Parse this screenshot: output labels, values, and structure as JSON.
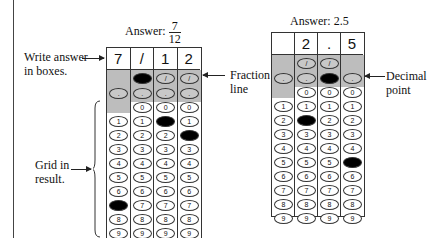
{
  "left_example": {
    "answer_label": "Answer:",
    "answer_numerator": "7",
    "answer_denominator": "12",
    "boxes": [
      "7",
      "/",
      "1",
      "2"
    ],
    "fraction_row_filled_col": 1,
    "fraction_row_cols": [
      2,
      3
    ],
    "decimal_row_cols": [
      0,
      1,
      2,
      3
    ],
    "zero_row_cols": [
      1,
      2,
      3
    ],
    "digits": [
      "0",
      "1",
      "2",
      "3",
      "4",
      "5",
      "6",
      "7",
      "8",
      "9"
    ],
    "filled_digits": [
      {
        "col": 0,
        "digit": "7"
      },
      {
        "col": 2,
        "digit": "1"
      },
      {
        "col": 3,
        "digit": "2"
      }
    ],
    "annotations": {
      "write_answer": [
        "Write answer",
        "in boxes."
      ],
      "fraction_line": [
        "Fraction",
        "line"
      ],
      "grid_in": [
        "Grid in",
        "result."
      ]
    }
  },
  "right_example": {
    "answer_label": "Answer: 2.5",
    "boxes": [
      "",
      "2",
      ".",
      "5"
    ],
    "fraction_row_cols": [
      1,
      2
    ],
    "decimal_row_cols": [
      0,
      1,
      3
    ],
    "decimal_row_filled_col": 2,
    "zero_row_cols": [
      1,
      2,
      3
    ],
    "filled_digits": [
      {
        "col": 1,
        "digit": "2"
      },
      {
        "col": 3,
        "digit": "5"
      }
    ],
    "annotations": {
      "decimal_point": [
        "Decimal",
        "point"
      ]
    }
  },
  "symbols": {
    "fraction_slash": "/",
    "decimal_dot": "."
  }
}
